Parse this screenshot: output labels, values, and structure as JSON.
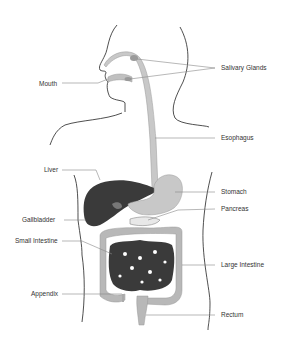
{
  "diagram": {
    "colors": {
      "outline": "#222222",
      "leader": "#888888",
      "organ_light": "#c8c8c8",
      "organ_mid": "#a8a8a8",
      "organ_dark": "#3a3a3a",
      "text": "#333333"
    },
    "labels": {
      "mouth": "Mouth",
      "salivary_glands": "Salivary Glands",
      "esophagus": "Esophagus",
      "liver": "Liver",
      "stomach": "Stomach",
      "pancreas": "Pancreas",
      "gallbladder": "Gallbladder",
      "small_intestine": "Small Intestine",
      "large_intestine": "Large Intestine",
      "appendix": "Appendix",
      "rectum": "Rectum"
    }
  }
}
